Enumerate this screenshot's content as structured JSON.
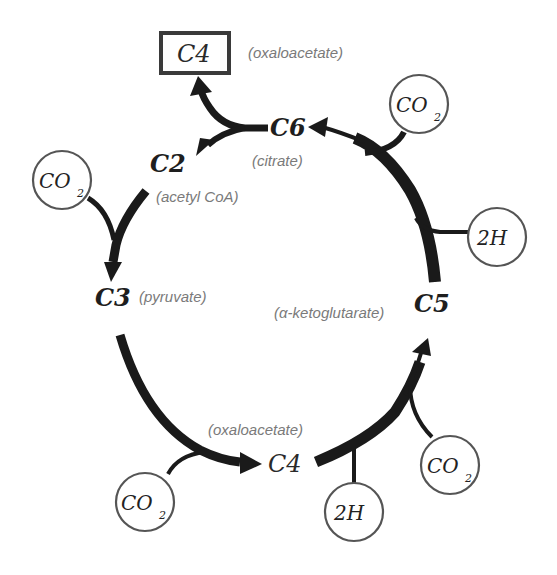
{
  "diagram": {
    "type": "metabolic-cycle",
    "title_box": {
      "label": "C4",
      "name": "(oxaloacetate)"
    },
    "nodes": [
      {
        "id": "c6",
        "label": "C6",
        "name": "(citrate)"
      },
      {
        "id": "c2",
        "label": "C2",
        "name": "(acetyl CoA)"
      },
      {
        "id": "c3",
        "label": "C3",
        "name": "(pyruvate)"
      },
      {
        "id": "c5",
        "label": "C5",
        "name": "(α-ketoglutarate)"
      },
      {
        "id": "c4",
        "label": "C4",
        "name": "(oxaloacetate)"
      }
    ],
    "inputs": [
      {
        "id": "co2-top-right",
        "label": "CO",
        "sub": "2",
        "joins": "C5→C6"
      },
      {
        "id": "2h-right",
        "label": "2H",
        "sub": "",
        "joins": "C5→C6"
      },
      {
        "id": "co2-left",
        "label": "CO",
        "sub": "2",
        "joins": "C2→C3"
      },
      {
        "id": "co2-bottom-left",
        "label": "CO",
        "sub": "2",
        "joins": "C3→C4"
      },
      {
        "id": "2h-bottom",
        "label": "2H",
        "sub": "",
        "joins": "C4→C5"
      },
      {
        "id": "co2-bottom-right",
        "label": "CO",
        "sub": "2",
        "joins": "C4→C5"
      }
    ],
    "edges": [
      {
        "from": "C6",
        "to": "C4 (oxaloacetate box)"
      },
      {
        "from": "C6",
        "to": "C2"
      },
      {
        "from": "C2",
        "to": "C3"
      },
      {
        "from": "C3",
        "to": "C4"
      },
      {
        "from": "C4",
        "to": "C5"
      },
      {
        "from": "C5",
        "to": "C6"
      }
    ]
  }
}
